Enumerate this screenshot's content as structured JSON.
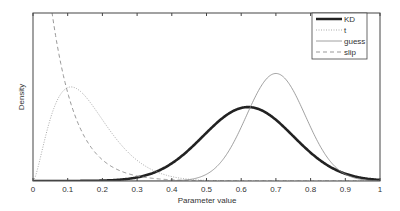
{
  "chart_data": {
    "type": "line",
    "title": "",
    "xlabel": "Parameter value",
    "ylabel": "Density",
    "xlim": [
      0,
      1
    ],
    "x_ticks": [
      "0",
      "0.1",
      "0.2",
      "0.3",
      "0.4",
      "0.5",
      "0.6",
      "0.7",
      "0.8",
      "0.9",
      "1"
    ],
    "grid": false,
    "legend_position": "upper right",
    "series": [
      {
        "name": "KD",
        "style": "thick solid",
        "color": "#222222",
        "peak_x": 0.62,
        "relative_peak": 0.44
      },
      {
        "name": "t",
        "style": "dotted",
        "color": "#aaaaaa",
        "peak_x": 0.11,
        "relative_peak": 0.56
      },
      {
        "name": "guess",
        "style": "thin solid",
        "color": "#888888",
        "peak_x": 0.7,
        "relative_peak": 0.64
      },
      {
        "name": "slip",
        "style": "dashed",
        "color": "#999999",
        "peak_x": 0.0,
        "relative_peak": 1.0
      }
    ]
  },
  "legend": {
    "items": [
      "KD",
      "t",
      "guess",
      "slip"
    ]
  }
}
